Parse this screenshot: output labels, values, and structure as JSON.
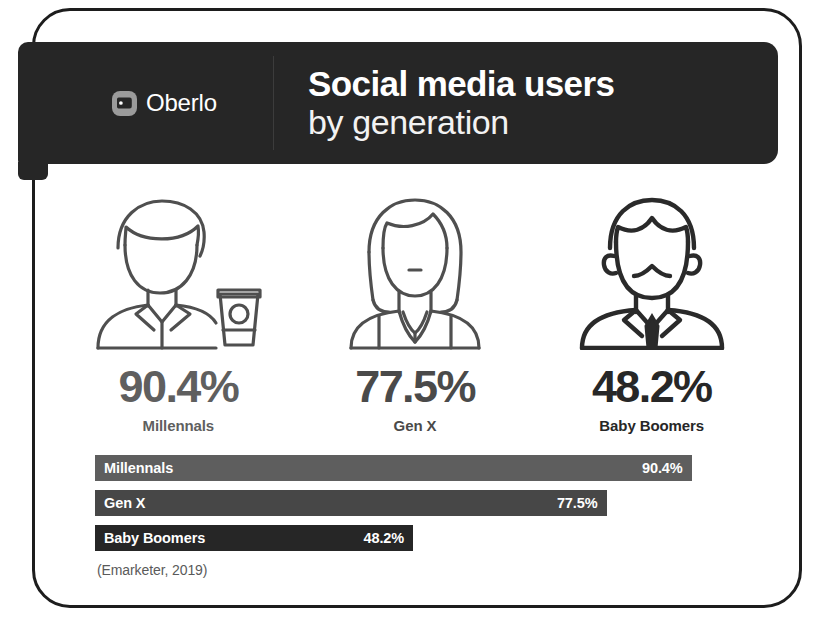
{
  "header": {
    "brand_name": "Oberlo",
    "brand_icon": "oberlo-tag-logo-icon",
    "title_line1": "Social media users",
    "title_line2": "by generation",
    "background_color": "#262626"
  },
  "people": [
    {
      "icon": "young-man-with-coffee-cup-icon",
      "value": "90.4%",
      "label": "Millennals",
      "tone": "tone-light",
      "color": "#5f5f5f"
    },
    {
      "icon": "young-woman-with-long-hair-icon",
      "value": "77.5%",
      "label": "Gen X",
      "tone": "tone-mid",
      "color": "#4a4a4a"
    },
    {
      "icon": "older-man-with-necktie-icon",
      "value": "48.2%",
      "label": "Baby Boomers",
      "tone": "tone-dark",
      "color": "#272727"
    }
  ],
  "source": "(Emarketer, 2019)",
  "chart_data": {
    "type": "bar",
    "orientation": "horizontal",
    "title": "Social media users by generation",
    "subtitle": "by generation",
    "categories": [
      "Millennals",
      "Gen X",
      "Baby Boomers"
    ],
    "values": [
      90.4,
      77.5,
      48.2
    ],
    "value_labels": [
      "90.4%",
      "77.5%",
      "48.2%"
    ],
    "bar_colors": [
      "#5e5e5e",
      "#474747",
      "#262626"
    ],
    "xlabel": "",
    "ylabel": "",
    "xlim": [
      0,
      100
    ],
    "unit": "%",
    "grid": false,
    "legend": false,
    "source": "(Emarketer, 2019)"
  }
}
